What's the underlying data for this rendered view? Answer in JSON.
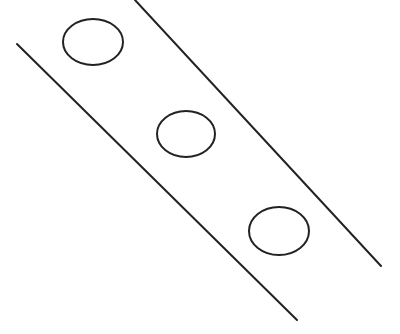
{
  "diagram": {
    "width": 400,
    "height": 334,
    "background": "#ffffff",
    "stroke_color": "#222222",
    "stroke_width": 2,
    "lines": [
      {
        "id": "left-boundary",
        "x1": 17,
        "y1": 44,
        "x2": 297,
        "y2": 320
      },
      {
        "id": "right-boundary",
        "x1": 135,
        "y1": 0,
        "x2": 381,
        "y2": 266
      }
    ],
    "ellipses": [
      {
        "id": "ellipse-1",
        "cx": 93,
        "cy": 42,
        "rx": 30,
        "ry": 23
      },
      {
        "id": "ellipse-2",
        "cx": 186,
        "cy": 134,
        "rx": 29,
        "ry": 23
      },
      {
        "id": "ellipse-3",
        "cx": 279,
        "cy": 231,
        "rx": 30,
        "ry": 24
      }
    ]
  }
}
